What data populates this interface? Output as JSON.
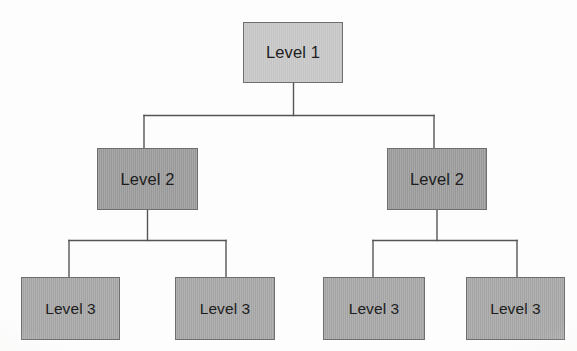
{
  "diagram": {
    "type": "hierarchy-tree",
    "levels": 3,
    "background_color": "#fdfdfd",
    "connector_color": "#555555",
    "connector_width": 1.4,
    "nodes": [
      {
        "id": "level1",
        "label": "Level 1",
        "level": 1,
        "x": 243,
        "y": 22,
        "width": 100,
        "height": 61,
        "fill": "#c6c6c6",
        "border": "#6e6e6e"
      },
      {
        "id": "level2-left",
        "label": "Level 2",
        "level": 2,
        "x": 97,
        "y": 148,
        "width": 101,
        "height": 62,
        "fill": "#9b9b9b",
        "border": "#6e6e6e"
      },
      {
        "id": "level2-right",
        "label": "Level 2",
        "level": 2,
        "x": 387,
        "y": 148,
        "width": 100,
        "height": 62,
        "fill": "#9b9b9b",
        "border": "#6e6e6e"
      },
      {
        "id": "level3-1",
        "label": "Level 3",
        "level": 3,
        "x": 21,
        "y": 277,
        "width": 99,
        "height": 63,
        "fill": "#a6a6a6",
        "border": "#6e6e6e"
      },
      {
        "id": "level3-2",
        "label": "Level 3",
        "level": 3,
        "x": 175,
        "y": 277,
        "width": 100,
        "height": 63,
        "fill": "#a6a6a6",
        "border": "#6e6e6e"
      },
      {
        "id": "level3-3",
        "label": "Level 3",
        "level": 3,
        "x": 323,
        "y": 277,
        "width": 102,
        "height": 63,
        "fill": "#a6a6a6",
        "border": "#6e6e6e"
      },
      {
        "id": "level3-4",
        "label": "Level 3",
        "level": 3,
        "x": 466,
        "y": 277,
        "width": 99,
        "height": 63,
        "fill": "#a6a6a6",
        "border": "#6e6e6e"
      }
    ],
    "edges": [
      {
        "id": "edge-root-left",
        "from": "level1",
        "to": "level2-left"
      },
      {
        "id": "edge-root-right",
        "from": "level1",
        "to": "level2-right"
      },
      {
        "id": "edge-l2l-c1",
        "from": "level2-left",
        "to": "level3-1"
      },
      {
        "id": "edge-l2l-c2",
        "from": "level2-left",
        "to": "level3-2"
      },
      {
        "id": "edge-l2r-c1",
        "from": "level2-right",
        "to": "level3-3"
      },
      {
        "id": "edge-l2r-c2",
        "from": "level2-right",
        "to": "level3-4"
      }
    ],
    "connector_paths": {
      "root_stem": "M 293.5 83 L 293.5 115.5",
      "root_bar": "M 144 115.5 L 434 115.5",
      "root_drop_left": "M 144 115.5 L 144 148",
      "root_drop_right": "M 434 115.5 L 434 148",
      "left_stem": "M 147.5 210 L 147.5 240.5",
      "left_bar": "M 69 240.5 L 226 240.5",
      "left_drop_1": "M 69 240.5 L 69 277",
      "left_drop_2": "M 226 240.5 L 226 277",
      "right_stem": "M 437 210 L 437 240.5",
      "right_bar": "M 373 240.5 L 517 240.5",
      "right_drop_1": "M 373 240.5 L 373 277",
      "right_drop_2": "M 517 240.5 L 517 277"
    }
  }
}
